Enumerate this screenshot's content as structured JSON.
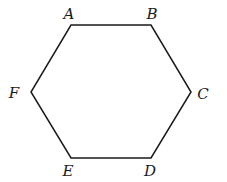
{
  "diagram": {
    "shape": "hexagon",
    "stroke_color": "#1a1a1a",
    "vertices": [
      {
        "label": "A",
        "x": 71,
        "y": 25,
        "lx": 69,
        "ly": 19
      },
      {
        "label": "B",
        "x": 151,
        "y": 25,
        "lx": 152,
        "ly": 19
      },
      {
        "label": "C",
        "x": 191,
        "y": 92,
        "lx": 203,
        "ly": 99
      },
      {
        "label": "D",
        "x": 151,
        "y": 158,
        "lx": 150,
        "ly": 176
      },
      {
        "label": "E",
        "x": 71,
        "y": 158,
        "lx": 68,
        "ly": 176
      },
      {
        "label": "F",
        "x": 31,
        "y": 92,
        "lx": 14,
        "ly": 98
      }
    ]
  }
}
